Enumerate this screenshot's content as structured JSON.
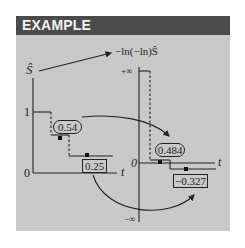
{
  "header": {
    "title": "EXAMPLE"
  },
  "left_plot": {
    "y_label": "Ŝ",
    "y_tick_top": "1",
    "y_tick_bottom": "0",
    "x_label": "t",
    "callouts": [
      {
        "value": "0.54",
        "shape": "oval"
      },
      {
        "value": "0.25",
        "shape": "box"
      }
    ]
  },
  "right_plot": {
    "y_label": "−ln(−ln)Ŝ",
    "y_tick_top": "+∞",
    "y_tick_zero": "0",
    "y_tick_bottom": "−∞",
    "x_label": "t",
    "callouts": [
      {
        "value": "0.484",
        "shape": "oval"
      },
      {
        "value": "−0.327",
        "shape": "box"
      }
    ]
  },
  "transforms": [
    {
      "from": "0.54",
      "to": "0.484"
    },
    {
      "from": "0.25",
      "to": "−0.327"
    }
  ],
  "colors": {
    "panel_bg": "#c9c9c9",
    "header_bg": "#4b4b4b",
    "header_text": "#f2f2f2",
    "ink": "#222222"
  }
}
